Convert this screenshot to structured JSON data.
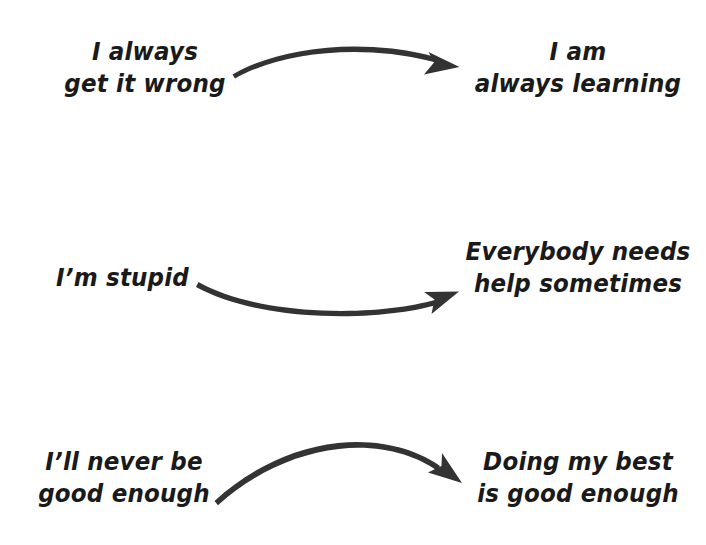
{
  "figure": {
    "type": "reframing-infographic",
    "background_color": "#ffffff",
    "ink_color": "#333333",
    "text_color": "#1a1a1a",
    "width": 706,
    "height": 545
  },
  "rows": [
    {
      "id": "row-1",
      "negative": {
        "line1": "I always",
        "line2": "get it wrong"
      },
      "arrow": {
        "direction": "left-to-right",
        "shape": "arc-up"
      },
      "positive": {
        "line1": "I am",
        "line2": "always learning"
      }
    },
    {
      "id": "row-2",
      "negative": {
        "line1": "I’m stupid",
        "line2": ""
      },
      "arrow": {
        "direction": "left-to-right",
        "shape": "arc-down"
      },
      "positive": {
        "line1": "Everybody needs",
        "line2": "help sometimes"
      }
    },
    {
      "id": "row-3",
      "negative": {
        "line1": "I’ll never be",
        "line2": "good enough"
      },
      "arrow": {
        "direction": "left-to-right",
        "shape": "arc-up-descending"
      },
      "positive": {
        "line1": "Doing my best",
        "line2": "is good enough"
      }
    }
  ]
}
